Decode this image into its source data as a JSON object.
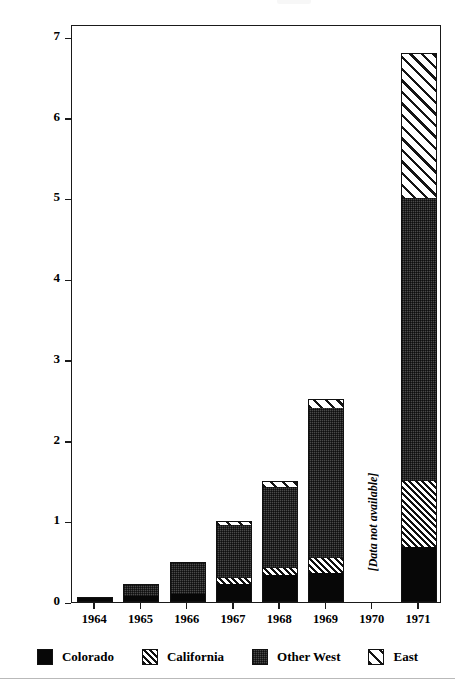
{
  "chart_data": {
    "type": "bar",
    "title": "",
    "xlabel": "",
    "ylabel": "Number of Stations (in Thousands)",
    "ylim": [
      0,
      7
    ],
    "yticks": [
      0,
      1,
      2,
      3,
      4,
      5,
      6,
      7
    ],
    "ytick_labels": [
      "0",
      "1",
      "2",
      "3",
      "4",
      "5",
      "6",
      "7"
    ],
    "grid": false,
    "stacked": true,
    "legend_position": "bottom",
    "categories": [
      "1964",
      "1965",
      "1966",
      "1967",
      "1968",
      "1969",
      "1970",
      "1971"
    ],
    "series": [
      {
        "name": "Colorado",
        "pattern": "solid-black",
        "color": "#070707",
        "values": [
          0.06,
          0.08,
          0.1,
          0.22,
          0.33,
          0.36,
          null,
          0.68
        ]
      },
      {
        "name": "California",
        "pattern": "dense-diagonal-hatch",
        "color": "#101010",
        "values": [
          0,
          0,
          0,
          0.08,
          0.09,
          0.19,
          null,
          0.82
        ]
      },
      {
        "name": "Other West",
        "pattern": "dark-stipple",
        "color": "#4a4a4a",
        "values": [
          0,
          0.14,
          0.4,
          0.65,
          1.0,
          1.85,
          null,
          3.5
        ]
      },
      {
        "name": "East",
        "pattern": "sparse-diagonal-hatch",
        "color": "#141414",
        "values": [
          0,
          0,
          0,
          0.05,
          0.08,
          0.12,
          null,
          1.8
        ]
      }
    ],
    "totals": [
      0.06,
      0.22,
      0.5,
      1.0,
      1.5,
      2.52,
      null,
      6.8
    ],
    "annotations": [
      {
        "text": "[Data not available]",
        "category": "1970",
        "orientation": "vertical",
        "style": "italic"
      }
    ]
  },
  "legend": {
    "items": [
      {
        "label": "Colorado",
        "swatch": "solid-black-swatch"
      },
      {
        "label": "California",
        "swatch": "dense-hatch-swatch"
      },
      {
        "label": "Other West",
        "swatch": "stipple-swatch"
      },
      {
        "label": "East",
        "swatch": "sparse-hatch-swatch"
      }
    ]
  }
}
